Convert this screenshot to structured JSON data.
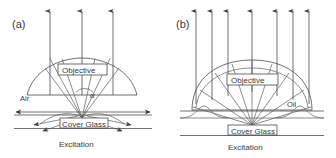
{
  "figure": {
    "background_color": "#ffffff",
    "line_color": "#4a4a4a",
    "text_color": "#3a3a3a",
    "panels": [
      {
        "id": "panel-a",
        "label": "(a)",
        "objective_label": "Objective",
        "medium_label": "Air",
        "angle_label": "α",
        "substrate_label": "Cover Glass",
        "caption": "Excitation",
        "emission_arrow_count": 3,
        "has_evanescent_arrows": true,
        "has_refracted_down_arrows": true
      },
      {
        "id": "panel-b",
        "label": "(b)",
        "objective_label": "Objective",
        "medium_label": "Oil",
        "substrate_label": "Cover Glass",
        "caption": "Excitation",
        "emission_arrow_count": 7,
        "has_evanescent_arrows": false,
        "has_refracted_down_arrows": false
      }
    ]
  }
}
